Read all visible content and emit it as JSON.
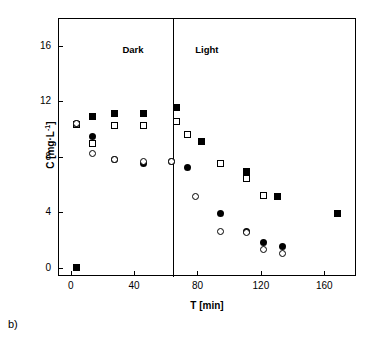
{
  "panel": {
    "label": "b)"
  },
  "chart_data": {
    "type": "scatter",
    "title": "",
    "xlabel": "T [min]",
    "ylabel": "C [mg·L-1]",
    "ylabel_parts": {
      "pre": "C [mg",
      "mid": "L",
      "sup": "-1",
      "post": "]"
    },
    "xlim": [
      -8,
      180
    ],
    "ylim": [
      -0.6,
      18
    ],
    "xticks": [
      0,
      40,
      80,
      120,
      160
    ],
    "yticks": [
      0,
      4,
      8,
      12,
      16
    ],
    "xtick_labels": [
      "0",
      "40",
      "80",
      "120",
      "160"
    ],
    "ytick_labels": [
      "0",
      "4",
      "8",
      "12",
      "16"
    ],
    "grid": false,
    "legend": "none",
    "annotations": [
      {
        "text": "Dark",
        "x": 32,
        "y": 16.2
      },
      {
        "text": "Light",
        "x": 78,
        "y": 16.2
      }
    ],
    "vertical_line_x": 64,
    "series": [
      {
        "name": "filled-square",
        "marker": "filled-square",
        "points": [
          {
            "x": 3,
            "y": 0.05
          },
          {
            "x": 13,
            "y": 11.0
          },
          {
            "x": 27,
            "y": 11.2
          },
          {
            "x": 45,
            "y": 11.2
          },
          {
            "x": 66,
            "y": 11.6
          },
          {
            "x": 82,
            "y": 9.2
          },
          {
            "x": 110,
            "y": 7.0
          },
          {
            "x": 130,
            "y": 5.2
          },
          {
            "x": 168,
            "y": 4.0
          }
        ]
      },
      {
        "name": "open-square",
        "marker": "open-square",
        "points": [
          {
            "x": 3,
            "y": 10.4
          },
          {
            "x": 13,
            "y": 9.0
          },
          {
            "x": 27,
            "y": 10.3
          },
          {
            "x": 45,
            "y": 10.3
          },
          {
            "x": 66,
            "y": 10.6
          },
          {
            "x": 73,
            "y": 9.7
          },
          {
            "x": 94,
            "y": 7.6
          },
          {
            "x": 110,
            "y": 6.5
          },
          {
            "x": 121,
            "y": 5.3
          }
        ]
      },
      {
        "name": "filled-circle",
        "marker": "filled-circle",
        "points": [
          {
            "x": 3,
            "y": 10.5
          },
          {
            "x": 13,
            "y": 9.5
          },
          {
            "x": 27,
            "y": 7.9
          },
          {
            "x": 45,
            "y": 7.6
          },
          {
            "x": 63,
            "y": 7.7
          },
          {
            "x": 73,
            "y": 7.3
          },
          {
            "x": 94,
            "y": 4.0
          },
          {
            "x": 110,
            "y": 2.7
          },
          {
            "x": 121,
            "y": 1.9
          },
          {
            "x": 133,
            "y": 1.6
          }
        ]
      },
      {
        "name": "open-circle",
        "marker": "open-circle",
        "points": [
          {
            "x": 3,
            "y": 10.5
          },
          {
            "x": 13,
            "y": 8.3
          },
          {
            "x": 27,
            "y": 7.9
          },
          {
            "x": 45,
            "y": 7.7
          },
          {
            "x": 63,
            "y": 7.7
          },
          {
            "x": 78,
            "y": 5.2
          },
          {
            "x": 94,
            "y": 2.7
          },
          {
            "x": 110,
            "y": 2.6
          },
          {
            "x": 121,
            "y": 1.4
          },
          {
            "x": 133,
            "y": 1.1
          }
        ]
      }
    ]
  }
}
